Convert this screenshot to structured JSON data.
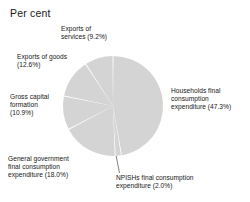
{
  "chart": {
    "title": "Per cent"
  },
  "chart_data": {
    "type": "pie",
    "title": "Per cent",
    "xlabel": "",
    "ylabel": "",
    "units": "percent",
    "legend_position": "none",
    "grid": false,
    "labels_outside": true,
    "start_angle_deg": 0,
    "direction": "clockwise",
    "total": 100.0,
    "categories": [
      "Households final consumption expenditure",
      "NPISHs final consumption expenditure",
      "General government final consumption expenditure",
      "Gross capital formation",
      "Exports of goods",
      "Exports of services"
    ],
    "values": [
      47.3,
      2.0,
      18.0,
      10.9,
      12.6,
      9.2
    ],
    "slices": [
      {
        "name": "households",
        "label_lines": [
          "Households final",
          "consumption",
          "expenditure (47.3%)"
        ],
        "value": 47.3,
        "value_text": "47.3%",
        "color": "#d4d4d4"
      },
      {
        "name": "npishs",
        "label_lines": [
          "NPISHs final consumption",
          "expenditure (2.0%)"
        ],
        "value": 2.0,
        "value_text": "2.0%",
        "color": "#d4d4d4",
        "has_leader_line": true
      },
      {
        "name": "general-government",
        "label_lines": [
          "General government",
          "final consumption",
          "expenditure (18.0%)"
        ],
        "value": 18.0,
        "value_text": "18.0%",
        "color": "#d4d4d4"
      },
      {
        "name": "gross-capital-formation",
        "label_lines": [
          "Gross capital",
          "formation",
          "(10.9%)"
        ],
        "value": 10.9,
        "value_text": "10.9%",
        "color": "#d4d4d4"
      },
      {
        "name": "exports-of-goods",
        "label_lines": [
          "Exports of goods",
          "(12.6%)"
        ],
        "value": 12.6,
        "value_text": "12.6%",
        "color": "#d4d4d4"
      },
      {
        "name": "exports-of-services",
        "label_lines": [
          "Exports of",
          "services (9.2%)"
        ],
        "value": 9.2,
        "value_text": "9.2%",
        "color": "#d4d4d4"
      }
    ],
    "colors": {
      "slice_fill": "#d4d4d4",
      "slice_separator": "#ffffff",
      "text": "#161616",
      "background": "#ffffff"
    },
    "geometry": {
      "center_x": 113,
      "center_y": 106,
      "radius": 50
    }
  }
}
